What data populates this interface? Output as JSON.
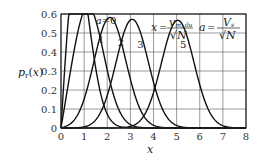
{
  "chart_data": {
    "type": "line",
    "title": "",
    "xlabel": "x",
    "ylabel": "p_r(x)",
    "xlim": [
      0,
      8
    ],
    "ylim": [
      0,
      0.6
    ],
    "grid": true,
    "xticks": [
      0,
      1,
      2,
      3,
      4,
      5,
      6,
      7,
      8
    ],
    "yticks": [
      0,
      0.1,
      0.2,
      0.3,
      0.4,
      0.5,
      0.6
    ],
    "xtick_labels": [
      "0",
      "1",
      "2",
      "3",
      "4",
      "5",
      "6",
      "7",
      "8"
    ],
    "ytick_labels": [
      "0",
      "0.1",
      "0.2",
      "0.3",
      "0.4",
      "0.5",
      "0.6"
    ],
    "formula": "p(x) = 2x·exp(-(x²+a²))·I0(2ax)",
    "annotations": {
      "x_def": "x = v_m,ilu / √N",
      "a_def": "a = V_s / √N"
    },
    "series": [
      {
        "name": "a=0",
        "label": "a=0",
        "a": 0,
        "peak": [
          0.71,
          0.61
        ],
        "label_pos": [
          1.5,
          0.55
        ]
      },
      {
        "name": "a=1",
        "label": "1",
        "a": 1,
        "peak": [
          1.2,
          0.5
        ],
        "label_pos": [
          1.6,
          0.45
        ]
      },
      {
        "name": "a=2",
        "label": "2",
        "a": 2,
        "peak": [
          2.2,
          0.43
        ],
        "label_pos": [
          2.45,
          0.43
        ]
      },
      {
        "name": "a=3",
        "label": "3",
        "a": 3,
        "peak": [
          3.2,
          0.41
        ],
        "label_pos": [
          3.3,
          0.42
        ]
      },
      {
        "name": "a=5",
        "label": "5",
        "a": 5,
        "peak": [
          5.1,
          0.4
        ],
        "label_pos": [
          5.15,
          0.42
        ]
      }
    ]
  }
}
